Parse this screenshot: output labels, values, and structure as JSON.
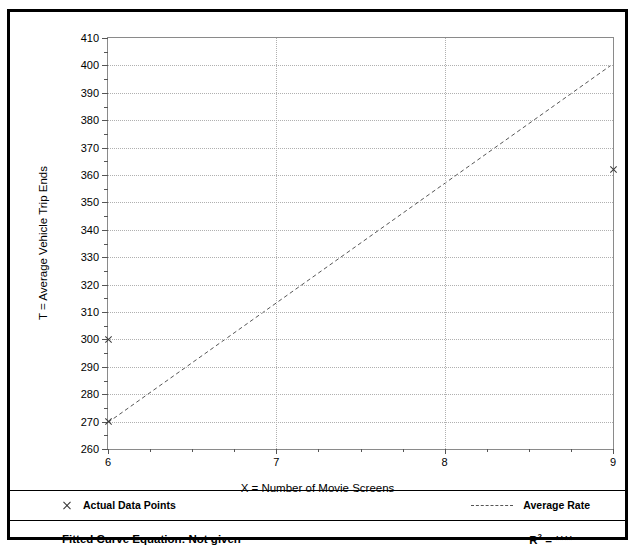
{
  "chart_data": {
    "type": "scatter",
    "title": "",
    "xlabel": "X = Number of Movie Screens",
    "ylabel": "T = Average Vehicle Trip Ends",
    "xlim": [
      6,
      9
    ],
    "ylim": [
      260,
      410
    ],
    "xticks": [
      6,
      7,
      8,
      9
    ],
    "xtick_labels": [
      "6",
      "7",
      "8",
      "9"
    ],
    "yticks": [
      260,
      270,
      280,
      290,
      300,
      310,
      320,
      330,
      340,
      350,
      360,
      370,
      380,
      390,
      400,
      410
    ],
    "ytick_labels": [
      "260",
      "270",
      "280",
      "290",
      "300",
      "310",
      "320",
      "330",
      "340",
      "350",
      "360",
      "370",
      "380",
      "390",
      "400",
      "410"
    ],
    "y_minor_interval": 5,
    "x_minor_interval": 0.25,
    "grid": true,
    "legend_position": "bottom",
    "series": [
      {
        "name": "Actual Data Points",
        "type": "scatter",
        "marker": "x",
        "points": [
          {
            "x": 6,
            "y": 300
          },
          {
            "x": 6,
            "y": 270
          },
          {
            "x": 9,
            "y": 362
          }
        ]
      },
      {
        "name": "Average Rate",
        "type": "line",
        "style": "dashed",
        "points": [
          {
            "x": 6,
            "y": 269
          },
          {
            "x": 9,
            "y": 400
          }
        ]
      }
    ]
  },
  "legend": {
    "data_points_label": "Actual Data Points",
    "average_rate_label": "Average Rate",
    "marker_icon": "x-marker-icon",
    "line_icon": "dashed-line-icon"
  },
  "footer": {
    "equation_label": "Fitted Curve Equation:  Not given",
    "r_squared_prefix": "R",
    "r_squared_exponent": "2",
    "r_squared_value": "= ****",
    "ghost_text": ""
  },
  "top_bleed": {
    "left_fragment": "",
    "right_fragment": ""
  },
  "colors": {
    "frame": "#000000",
    "plot_border": "#8a8a8a",
    "gridline": "#b0b0b0",
    "marker": "#3a3a3a",
    "trend_line": "#555555",
    "text": "#000000"
  }
}
